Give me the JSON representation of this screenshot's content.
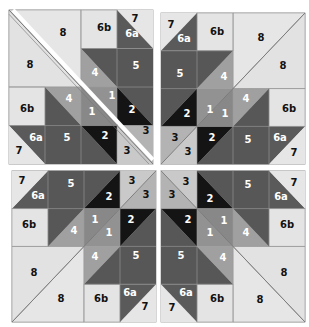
{
  "colors": {
    "light": "#e4e4e4",
    "c1": "#8c8c8c",
    "c2": "#141414",
    "c3a": "#c9c9c9",
    "c3b": "#b3b3b3",
    "c4": "#a0a0a0",
    "c5": "#575757",
    "c6a": "#5a5a5a",
    "seam": "#888888"
  },
  "labels": {
    "p1": "1",
    "p2": "2",
    "p3": "3",
    "p4": "4",
    "p5": "5",
    "p6a": "6a",
    "p6b": "6b",
    "p7": "7",
    "p8": "8"
  },
  "blocks": [
    {
      "name": "top-left",
      "transform": "none"
    },
    {
      "name": "top-right",
      "transform": "mirror-horizontal"
    },
    {
      "name": "bottom-left",
      "transform": "mirror-vertical"
    },
    {
      "name": "bottom-right",
      "transform": "rotate-180"
    }
  ]
}
